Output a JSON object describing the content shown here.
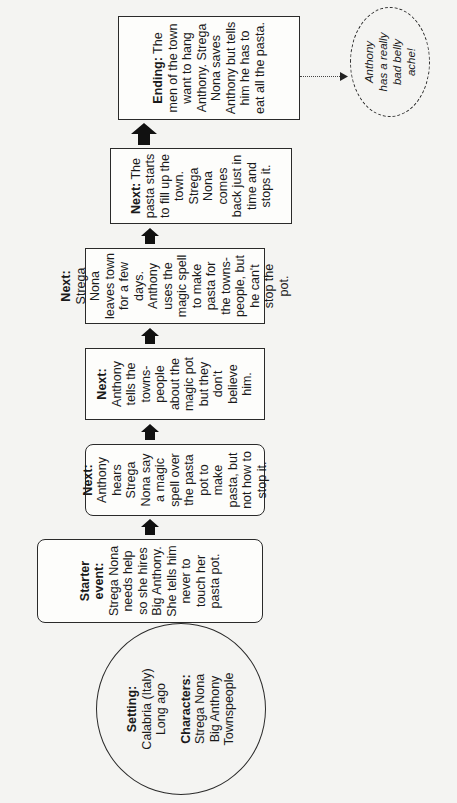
{
  "diagram": {
    "orientation": "rotated 90deg counter-clockwise",
    "setting": {
      "label": "Setting:",
      "lines": [
        "Calabria (Italy)",
        "Long ago"
      ],
      "characters_label": "Characters:",
      "characters": [
        "Strega Nona",
        "Big Anthony",
        "Townspeople"
      ]
    },
    "steps": [
      {
        "label": "Starter event:",
        "text": "Strega Nona needs help so she hires Big Anthony. She tells him never to touch her pasta pot."
      },
      {
        "label": "Next:",
        "text": "Anthony hears Strega Nona say a magic spell over the pasta pot to make pasta, but not how to stop it."
      },
      {
        "label": "Next:",
        "text": "Anthony tells the towns-people about the magic pot but they don't believe him."
      },
      {
        "label": "Next:",
        "text": "Strega Nona leaves town for a few days. Anthony uses the magic spell to make pasta for the towns-people, but he can't stop the pot."
      },
      {
        "label": "Next:",
        "text": "The pasta starts to fill up the town. Strega Nona comes back just in time and stops it."
      },
      {
        "label": "Ending:",
        "text": "The men of the town want to hang Anthony. Strega Nona saves Anthony but tells him he has to eat all the pasta."
      }
    ],
    "outcome": {
      "text": "Anthony has a really bad belly ache!"
    }
  }
}
